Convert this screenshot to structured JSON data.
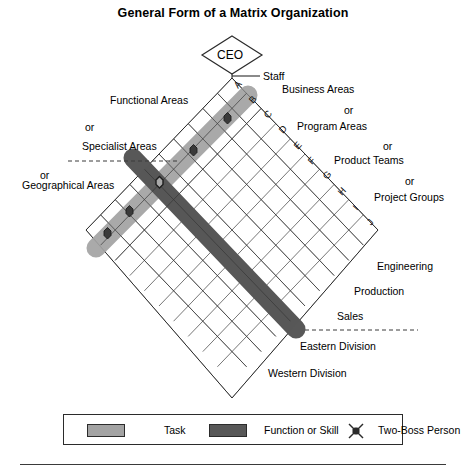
{
  "title": "General Form of a Matrix Organization",
  "top": {
    "ceo_label": "CEO",
    "staff_label": "Staff"
  },
  "row_letters": [
    "A",
    "B",
    "C",
    "D",
    "E",
    "F",
    "G",
    "H",
    "I",
    "J"
  ],
  "left_labels": [
    {
      "text": "Functional Areas"
    },
    {
      "text": "or"
    },
    {
      "text": "Specialist Areas"
    },
    {
      "text": "or"
    },
    {
      "text": "Geographical Areas"
    }
  ],
  "right_labels": [
    {
      "text": "Business Areas"
    },
    {
      "text": "or"
    },
    {
      "text": "Program Areas"
    },
    {
      "text": "or"
    },
    {
      "text": "Product Teams"
    },
    {
      "text": "or"
    },
    {
      "text": "Project Groups"
    }
  ],
  "lower_right_labels": [
    {
      "text": "Engineering"
    },
    {
      "text": "Production"
    },
    {
      "text": "Sales"
    },
    {
      "text": "Eastern Division"
    },
    {
      "text": "Western Division"
    }
  ],
  "legend": {
    "items": [
      {
        "label": "Task",
        "swatch_color": "#a3a3a3",
        "type": "swatch"
      },
      {
        "label": "Function or Skill",
        "swatch_color": "#585858",
        "type": "swatch"
      },
      {
        "label": "Two-Boss Person",
        "swatch_color": "#2b2b2b",
        "type": "marker"
      }
    ]
  },
  "colors": {
    "task_bar": "#a3a3a3",
    "function_bar": "#585858",
    "grid_line": "#4a4a4a",
    "outline": "#2b2b2b",
    "marker_fill": "#3a3a3a",
    "background": "#ffffff"
  },
  "diagram": {
    "grid_rows": 10,
    "grid_cols": 10,
    "task_bar_label": "Task",
    "function_bar_label": "Function or Skill",
    "two_boss_marker_count": 5
  }
}
